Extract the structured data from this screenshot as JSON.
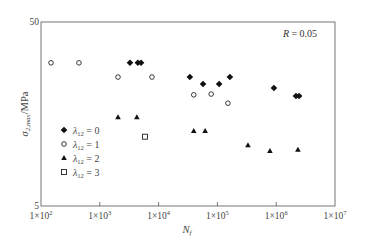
{
  "chart_data": {
    "type": "scatter",
    "title": "",
    "xlabel": "N_f",
    "ylabel": "σ_{2,max}/MPa",
    "xscale": "log",
    "yscale": "log",
    "xlim": [
      100,
      10000000
    ],
    "ylim": [
      5,
      50
    ],
    "x_ticks": [
      {
        "value": 100,
        "label": "1×10",
        "exp": "2"
      },
      {
        "value": 1000,
        "label": "1×10",
        "exp": "3"
      },
      {
        "value": 10000,
        "label": "1×10",
        "exp": "4"
      },
      {
        "value": 100000,
        "label": "1×10",
        "exp": "5"
      },
      {
        "value": 1000000,
        "label": "1×10",
        "exp": "6"
      },
      {
        "value": 10000000,
        "label": "1×10",
        "exp": "7"
      }
    ],
    "y_ticks": [
      {
        "value": 5,
        "label": "5"
      },
      {
        "value": 50,
        "label": "50"
      }
    ],
    "grid": false,
    "legend_position": "lower-left inside",
    "annotation": "R = 0.05",
    "series": [
      {
        "name": "λ12 = 0",
        "marker": "filled-diamond",
        "points": [
          [
            3260,
            30
          ],
          [
            4440,
            30
          ],
          [
            5030,
            30
          ],
          [
            34000,
            25.1
          ],
          [
            57000,
            23.0
          ],
          [
            107000,
            23.0
          ],
          [
            163000,
            25.1
          ],
          [
            915000,
            21.9
          ],
          [
            2170000,
            19.8
          ],
          [
            2450000,
            19.8
          ]
        ]
      },
      {
        "name": "λ12 = 1",
        "marker": "open-circle",
        "points": [
          [
            148,
            30
          ],
          [
            442,
            30
          ],
          [
            2040,
            25.1
          ],
          [
            7710,
            25.1
          ],
          [
            39600,
            20.1
          ],
          [
            78400,
            20.3
          ],
          [
            151000,
            18.1
          ]
        ]
      },
      {
        "name": "λ12 = 2",
        "marker": "filled-triangle",
        "points": [
          [
            2040,
            15.2
          ],
          [
            4270,
            15.2
          ],
          [
            39600,
            12.8
          ],
          [
            61800,
            12.8
          ],
          [
            331000,
            10.7
          ],
          [
            782000,
            9.95
          ],
          [
            2340000,
            10.1
          ]
        ]
      },
      {
        "name": "λ12 = 3",
        "marker": "open-square",
        "points": [
          [
            5870,
            11.9
          ]
        ]
      }
    ]
  },
  "labels": {
    "annotation_R": "R",
    "annotation_eq": " = 0.05",
    "y_axis_sigma": "σ",
    "y_axis_sub": "2,max",
    "y_axis_unit": "/MPa",
    "x_axis_N": "N",
    "x_axis_sub": "f",
    "legend": [
      {
        "lambda": "λ",
        "sub": "12",
        "eq": " = 0"
      },
      {
        "lambda": "λ",
        "sub": "12",
        "eq": " = 1"
      },
      {
        "lambda": "λ",
        "sub": "12",
        "eq": " = 2"
      },
      {
        "lambda": "λ",
        "sub": "12",
        "eq": " = 3"
      }
    ]
  }
}
